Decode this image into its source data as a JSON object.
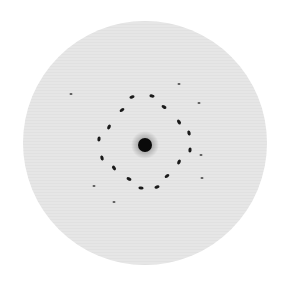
{
  "image": {
    "description": "Grayscale electron/X-ray diffraction pattern: a light gray circular disk with a dark central beam spot surrounded by a ring of dark elongated reflection spots and a few faint outer spots.",
    "width": 285,
    "height": 290,
    "background_color": "#ffffff",
    "disk": {
      "cx": 145,
      "cy": 143,
      "r": 122,
      "fill": "#e6e6e6"
    },
    "central_spot": {
      "cx": 145,
      "cy": 145,
      "r": 7,
      "halo_r": 14,
      "color": "#0a0a0a"
    },
    "ring_spots": [
      {
        "x": 132,
        "y": 97
      },
      {
        "x": 152,
        "y": 96
      },
      {
        "x": 164,
        "y": 107
      },
      {
        "x": 122,
        "y": 110
      },
      {
        "x": 109,
        "y": 127
      },
      {
        "x": 179,
        "y": 122
      },
      {
        "x": 189,
        "y": 133
      },
      {
        "x": 99,
        "y": 139
      },
      {
        "x": 190,
        "y": 150
      },
      {
        "x": 102,
        "y": 158
      },
      {
        "x": 179,
        "y": 162
      },
      {
        "x": 114,
        "y": 168
      },
      {
        "x": 167,
        "y": 176
      },
      {
        "x": 129,
        "y": 179
      },
      {
        "x": 141,
        "y": 188
      },
      {
        "x": 157,
        "y": 187
      }
    ],
    "faint_spots": [
      {
        "x": 179,
        "y": 84
      },
      {
        "x": 199,
        "y": 103
      },
      {
        "x": 71,
        "y": 94
      },
      {
        "x": 202,
        "y": 178
      },
      {
        "x": 94,
        "y": 186
      },
      {
        "x": 114,
        "y": 202
      },
      {
        "x": 201,
        "y": 155
      }
    ],
    "spot_color": "#1a1a1a",
    "faint_spot_color": "#555555"
  }
}
